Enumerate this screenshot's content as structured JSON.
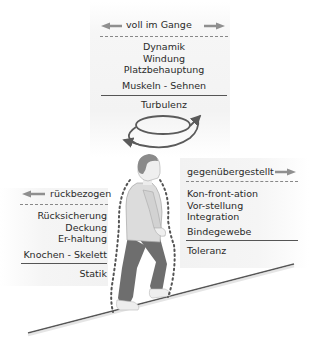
{
  "top_panel": {
    "header": "voll im Gange",
    "header_arrows": [
      "arrow-left",
      "arrow-right"
    ],
    "items": [
      "Dynamik",
      "Windung",
      "Platzbehauptung"
    ],
    "tissue": "Muskeln - Sehnen",
    "footer": "Turbulenz",
    "symbol": "spiral-arrow"
  },
  "left_panel": {
    "header": "rückbezogen",
    "header_arrows": [
      "arrow-left"
    ],
    "items": [
      "Rücksicherung",
      "Deckung",
      "Er-haltung"
    ],
    "tissue": "Knochen - Skelett",
    "footer": "Statik"
  },
  "right_panel": {
    "header": "gegenübergestellt",
    "header_arrows": [
      "arrow-right"
    ],
    "items": [
      "Kon-front-ation",
      "Vor-stellung",
      "Integration"
    ],
    "tissue": "Bindegewebe",
    "footer": "Toleranz"
  },
  "colors": {
    "text": "#2a2a2a",
    "arrow": "#8a8a8a",
    "spiral": "#5a5a5a",
    "figure_shirt": "#d8d8d8",
    "figure_pants": "#6e6e6e",
    "figure_hair": "#8a8a8a",
    "slope": "#555555"
  }
}
